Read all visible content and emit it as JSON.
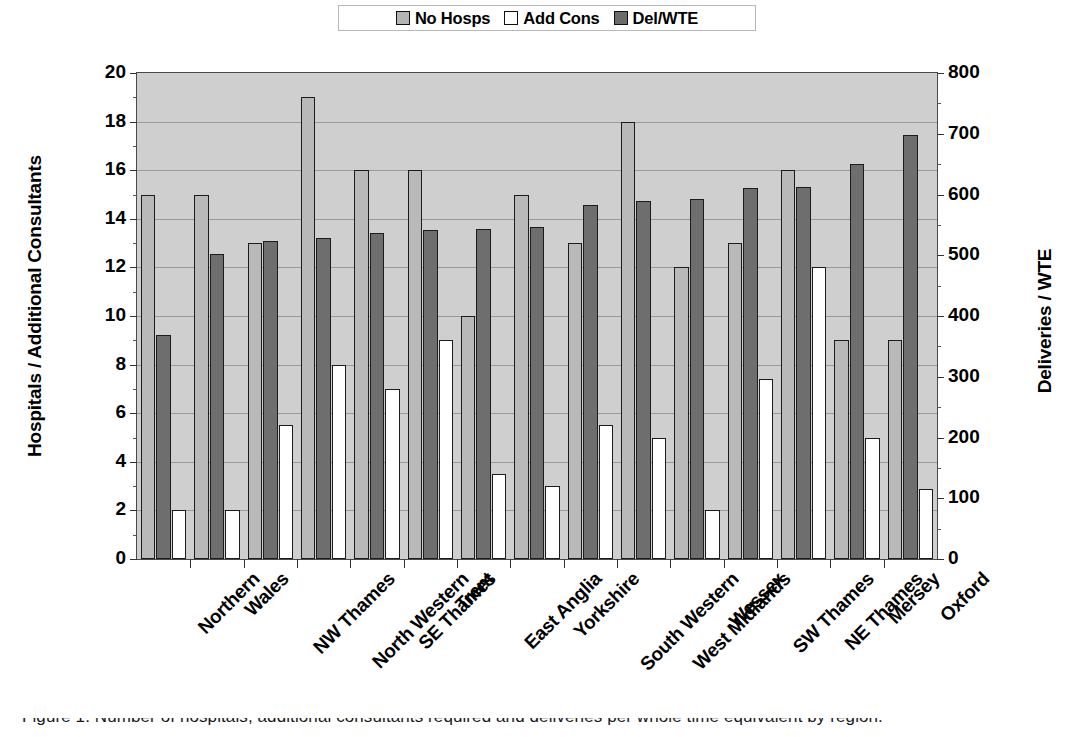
{
  "legend": {
    "position": "top-center",
    "entries": [
      {
        "label": "No Hosps",
        "color": "#b4b4b4",
        "icon": "legend-swatch-icon"
      },
      {
        "label": "Add Cons",
        "color": "#ffffff",
        "icon": "legend-swatch-icon"
      },
      {
        "label": "Del/WTE",
        "color": "#6b6b6b",
        "icon": "legend-swatch-icon"
      }
    ]
  },
  "axes": {
    "left_title": "Hospitals / Additional Consultants",
    "right_title": "Deliveries / WTE",
    "left_ticks": [
      "0",
      "2",
      "4",
      "6",
      "8",
      "10",
      "12",
      "14",
      "16",
      "18",
      "20"
    ],
    "right_ticks": [
      "0",
      "100",
      "200",
      "300",
      "400",
      "500",
      "600",
      "700",
      "800"
    ]
  },
  "caption": "Figure 1. Number of hospitals, additional consultants required and deliveries per whole time equivalent by region.",
  "chart_data": {
    "type": "bar",
    "title": "",
    "xlabel": "",
    "ylabel": "Hospitals / Additional Consultants",
    "ylabel_secondary": "Deliveries / WTE",
    "ylim": [
      0,
      20
    ],
    "ylim_secondary": [
      0,
      800
    ],
    "ytick_step": 2,
    "ytick_step_secondary": 100,
    "grid": true,
    "plot_background": "#cfcfcf",
    "legend_position": "top-center",
    "categories": [
      "Northern",
      "Wales",
      "NW Thames",
      "North Western",
      "SE Thames",
      "Trent",
      "East Anglia",
      "Yorkshire",
      "South Western",
      "West Midlands",
      "Wessex",
      "SW Thames",
      "NE Thames",
      "Mersey",
      "Oxford"
    ],
    "series": [
      {
        "name": "No Hosps",
        "axis": "left",
        "color": "#b9b9b9",
        "values": [
          15,
          15,
          13,
          19,
          16,
          16,
          10,
          15,
          13,
          18,
          12,
          13,
          16,
          9,
          9
        ]
      },
      {
        "name": "Del/WTE",
        "axis": "right",
        "color": "#6e6e6e",
        "values": [
          370,
          502,
          524,
          528,
          536,
          542,
          544,
          546,
          582,
          590,
          592,
          610,
          612,
          650,
          698
        ],
        "values_left_scale": [
          9.2,
          12.55,
          13.1,
          13.2,
          13.4,
          13.55,
          13.6,
          13.65,
          14.55,
          14.75,
          14.8,
          15.25,
          15.3,
          16.25,
          17.45
        ]
      },
      {
        "name": "Add Cons",
        "axis": "left",
        "color": "#ffffff",
        "values": [
          2,
          2,
          5.5,
          8,
          7,
          9,
          3.5,
          3,
          5.5,
          5,
          2,
          7.4,
          12,
          5,
          2.9
        ]
      }
    ]
  }
}
